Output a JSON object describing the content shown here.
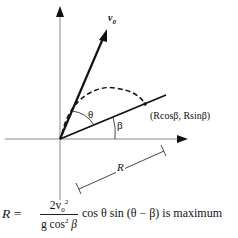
{
  "diagram": {
    "labels": {
      "v0": "v",
      "v0_sub": "0",
      "theta": "θ",
      "beta": "β",
      "point": "(Rcosβ, Rsinβ)",
      "range": "R"
    },
    "formula": {
      "lhs": "R =",
      "numerator": "2v",
      "numerator_sub": "0",
      "numerator_sup": "2",
      "denominator": "g cos",
      "denominator_sup": "2",
      "denominator_end": "β",
      "rhs": "cos θ sin (θ − β) is maximum"
    }
  }
}
